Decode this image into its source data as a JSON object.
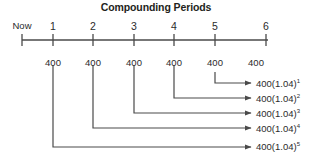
{
  "title": "Compounding Periods",
  "colors": {
    "ink": "#2b2b2b",
    "line": "#4a4a4a",
    "background": "#ffffff"
  },
  "timeline": {
    "axis_y": 40,
    "x_start": 22,
    "x_end": 268,
    "label_y": 20,
    "ticks": [
      {
        "label": "Now",
        "x": 22
      },
      {
        "label": "1",
        "x": 53
      },
      {
        "label": "2",
        "x": 93
      },
      {
        "label": "3",
        "x": 134
      },
      {
        "label": "4",
        "x": 174
      },
      {
        "label": "5",
        "x": 215
      },
      {
        "label": "6",
        "x": 266
      }
    ]
  },
  "payments": {
    "label_y": 57,
    "items": [
      {
        "value": "400",
        "x": 53
      },
      {
        "value": "400",
        "x": 93
      },
      {
        "value": "400",
        "x": 134
      },
      {
        "value": "400",
        "x": 174
      },
      {
        "value": "400",
        "x": 215
      },
      {
        "value": "400",
        "x": 256
      }
    ]
  },
  "brackets": [
    {
      "from_x": 215,
      "turn_y": 83,
      "arrow_x": 251,
      "top_y": 72
    },
    {
      "from_x": 174,
      "turn_y": 98,
      "arrow_x": 251,
      "top_y": 65
    },
    {
      "from_x": 134,
      "turn_y": 113,
      "arrow_x": 251,
      "top_y": 65
    },
    {
      "from_x": 93,
      "turn_y": 128,
      "arrow_x": 251,
      "top_y": 65
    },
    {
      "from_x": 53,
      "turn_y": 147,
      "arrow_x": 251,
      "top_y": 65
    }
  ],
  "formulas": [
    {
      "base": "400(1.04)",
      "exponent": "1",
      "x": 256,
      "y": 79
    },
    {
      "base": "400(1.04)",
      "exponent": "2",
      "x": 256,
      "y": 94
    },
    {
      "base": "400(1.04)",
      "exponent": "3",
      "x": 256,
      "y": 109
    },
    {
      "base": "400(1.04)",
      "exponent": "4",
      "x": 256,
      "y": 124
    },
    {
      "base": "400(1.04)",
      "exponent": "5",
      "x": 256,
      "y": 142
    }
  ]
}
